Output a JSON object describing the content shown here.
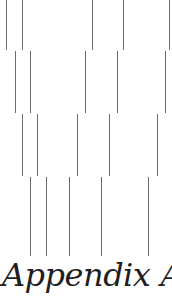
{
  "page": {
    "heading": {
      "word": "Appendix",
      "letter": "A"
    }
  },
  "decoration": {
    "line_color": "#6b6b6b",
    "rows": [
      {
        "top": 0,
        "bottom": 50,
        "xs": [
          6,
          22,
          92,
          123,
          169
        ]
      },
      {
        "top": 51,
        "bottom": 113,
        "xs": [
          15,
          30,
          85,
          117,
          165
        ]
      },
      {
        "top": 114,
        "bottom": 176,
        "xs": [
          22,
          37,
          77,
          109,
          157
        ]
      },
      {
        "top": 177,
        "bottom": 256,
        "xs": [
          30,
          46,
          69,
          101,
          148
        ]
      }
    ]
  }
}
